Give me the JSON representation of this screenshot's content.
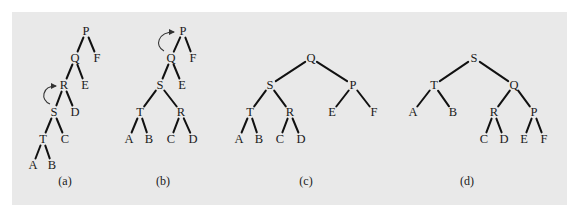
{
  "figure": {
    "background_color": "#e9e9e9",
    "panel_rect": {
      "x": 12,
      "y": 12,
      "w": 555,
      "h": 193
    },
    "trees": [
      {
        "id": "a",
        "caption": "(a)",
        "caption_pos": [
          65,
          181
        ],
        "nodes": [
          {
            "label": "P",
            "x": 86,
            "y": 31
          },
          {
            "label": "Q",
            "x": 75,
            "y": 58
          },
          {
            "label": "F",
            "x": 97,
            "y": 58
          },
          {
            "label": "R",
            "x": 64,
            "y": 85
          },
          {
            "label": "E",
            "x": 85,
            "y": 85
          },
          {
            "label": "S",
            "x": 54,
            "y": 112
          },
          {
            "label": "D",
            "x": 75,
            "y": 112
          },
          {
            "label": "T",
            "x": 43,
            "y": 139
          },
          {
            "label": "C",
            "x": 65,
            "y": 139
          },
          {
            "label": "A",
            "x": 33,
            "y": 165
          },
          {
            "label": "B",
            "x": 52,
            "y": 165
          }
        ],
        "edges": [
          [
            "P",
            "Q"
          ],
          [
            "P",
            "F"
          ],
          [
            "Q",
            "R"
          ],
          [
            "Q",
            "E"
          ],
          [
            "R",
            "S"
          ],
          [
            "R",
            "D"
          ],
          [
            "S",
            "T"
          ],
          [
            "S",
            "C"
          ],
          [
            "T",
            "A"
          ],
          [
            "T",
            "B"
          ]
        ],
        "rotation_arrow": {
          "from": "S",
          "to": "R",
          "path": "M 50 104 C 40 100, 42 86, 56 86"
        }
      },
      {
        "id": "b",
        "caption": "(b)",
        "caption_pos": [
          163,
          181
        ],
        "nodes": [
          {
            "label": "P",
            "x": 183,
            "y": 31
          },
          {
            "label": "Q",
            "x": 171,
            "y": 58
          },
          {
            "label": "F",
            "x": 193,
            "y": 58
          },
          {
            "label": "S",
            "x": 160,
            "y": 85
          },
          {
            "label": "E",
            "x": 182,
            "y": 85
          },
          {
            "label": "T",
            "x": 140,
            "y": 112
          },
          {
            "label": "R",
            "x": 181,
            "y": 112
          },
          {
            "label": "A",
            "x": 129,
            "y": 139
          },
          {
            "label": "B",
            "x": 149,
            "y": 139
          },
          {
            "label": "C",
            "x": 171,
            "y": 139
          },
          {
            "label": "D",
            "x": 193,
            "y": 139
          }
        ],
        "edges": [
          [
            "P",
            "Q"
          ],
          [
            "P",
            "F"
          ],
          [
            "Q",
            "S"
          ],
          [
            "Q",
            "E"
          ],
          [
            "S",
            "T"
          ],
          [
            "S",
            "R"
          ],
          [
            "T",
            "A"
          ],
          [
            "T",
            "B"
          ],
          [
            "R",
            "C"
          ],
          [
            "R",
            "D"
          ]
        ],
        "rotation_arrow": {
          "from": "Q",
          "to": "P",
          "path": "M 164 51 C 154 46, 158 32, 174 32"
        }
      },
      {
        "id": "c",
        "caption": "(c)",
        "caption_pos": [
          306,
          181
        ],
        "nodes": [
          {
            "label": "Q",
            "x": 311,
            "y": 58
          },
          {
            "label": "S",
            "x": 270,
            "y": 85
          },
          {
            "label": "P",
            "x": 353,
            "y": 85
          },
          {
            "label": "T",
            "x": 250,
            "y": 112
          },
          {
            "label": "R",
            "x": 290,
            "y": 112
          },
          {
            "label": "E",
            "x": 332,
            "y": 112
          },
          {
            "label": "F",
            "x": 374,
            "y": 112
          },
          {
            "label": "A",
            "x": 239,
            "y": 139
          },
          {
            "label": "B",
            "x": 259,
            "y": 139
          },
          {
            "label": "C",
            "x": 280,
            "y": 139
          },
          {
            "label": "D",
            "x": 301,
            "y": 139
          }
        ],
        "edges": [
          [
            "Q",
            "S"
          ],
          [
            "Q",
            "P"
          ],
          [
            "S",
            "T"
          ],
          [
            "S",
            "R"
          ],
          [
            "P",
            "E"
          ],
          [
            "P",
            "F"
          ],
          [
            "T",
            "A"
          ],
          [
            "T",
            "B"
          ],
          [
            "R",
            "C"
          ],
          [
            "R",
            "D"
          ]
        ],
        "rotation_arrow": null
      },
      {
        "id": "d",
        "caption": "(d)",
        "caption_pos": [
          467,
          181
        ],
        "nodes": [
          {
            "label": "S",
            "x": 474,
            "y": 58
          },
          {
            "label": "T",
            "x": 434,
            "y": 85
          },
          {
            "label": "Q",
            "x": 514,
            "y": 85
          },
          {
            "label": "A",
            "x": 413,
            "y": 112
          },
          {
            "label": "B",
            "x": 453,
            "y": 112
          },
          {
            "label": "R",
            "x": 494,
            "y": 112
          },
          {
            "label": "P",
            "x": 534,
            "y": 112
          },
          {
            "label": "C",
            "x": 484,
            "y": 139
          },
          {
            "label": "D",
            "x": 504,
            "y": 139
          },
          {
            "label": "E",
            "x": 524,
            "y": 139
          },
          {
            "label": "F",
            "x": 544,
            "y": 139
          }
        ],
        "edges": [
          [
            "S",
            "T"
          ],
          [
            "S",
            "Q"
          ],
          [
            "T",
            "A"
          ],
          [
            "T",
            "B"
          ],
          [
            "Q",
            "R"
          ],
          [
            "Q",
            "P"
          ],
          [
            "R",
            "C"
          ],
          [
            "R",
            "D"
          ],
          [
            "P",
            "E"
          ],
          [
            "P",
            "F"
          ]
        ],
        "rotation_arrow": null
      }
    ]
  }
}
